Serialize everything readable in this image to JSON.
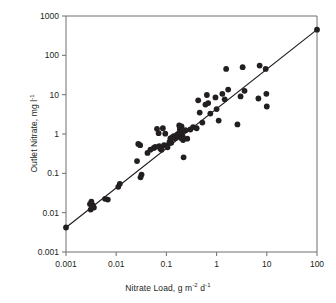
{
  "chart_data": {
    "type": "scatter",
    "title": "",
    "xlabel": "Nitrate Load, g m-2 d-1",
    "ylabel": "Outlet Nitrate, mg l-1",
    "xlabel_parts": {
      "text": "Nitrate Load, g m",
      "sup1": "-2",
      "mid": " d",
      "sup2": "-1"
    },
    "ylabel_parts": {
      "text": "Outlet Nitrate, mg l",
      "sup1": "-1"
    },
    "xscale": "log",
    "yscale": "log",
    "xlim": [
      0.001,
      100
    ],
    "ylim": [
      0.001,
      1000
    ],
    "xticks": [
      0.001,
      0.01,
      0.1,
      1,
      10,
      100
    ],
    "xtick_labels": [
      "0.001",
      "0.01",
      "0.1",
      "1",
      "10",
      "100"
    ],
    "yticks": [
      0.001,
      0.01,
      0.1,
      1,
      10,
      100,
      1000
    ],
    "ytick_labels": [
      "0.001",
      "0.01",
      "0.1",
      "1",
      "10",
      "100",
      "1000"
    ],
    "grid": false,
    "legend": false,
    "marker": {
      "shape": "circle",
      "color": "#231f20",
      "size": 4.6
    },
    "trendline": {
      "type": "line",
      "color": "#231f20",
      "width": 1.2,
      "x": [
        0.001,
        100
      ],
      "y": [
        0.0042,
        450
      ]
    },
    "points": [
      {
        "x": 0.001,
        "y": 0.0042
      },
      {
        "x": 0.003,
        "y": 0.0165
      },
      {
        "x": 0.0031,
        "y": 0.012
      },
      {
        "x": 0.0032,
        "y": 0.019
      },
      {
        "x": 0.0034,
        "y": 0.0155
      },
      {
        "x": 0.0036,
        "y": 0.0135
      },
      {
        "x": 0.006,
        "y": 0.0225
      },
      {
        "x": 0.0068,
        "y": 0.0215
      },
      {
        "x": 0.011,
        "y": 0.0455
      },
      {
        "x": 0.0118,
        "y": 0.054
      },
      {
        "x": 0.026,
        "y": 0.205
      },
      {
        "x": 0.0275,
        "y": 0.56
      },
      {
        "x": 0.03,
        "y": 0.52
      },
      {
        "x": 0.0305,
        "y": 0.079
      },
      {
        "x": 0.032,
        "y": 0.093
      },
      {
        "x": 0.042,
        "y": 0.33
      },
      {
        "x": 0.048,
        "y": 0.4
      },
      {
        "x": 0.056,
        "y": 0.44
      },
      {
        "x": 0.06,
        "y": 0.47
      },
      {
        "x": 0.065,
        "y": 1.35
      },
      {
        "x": 0.07,
        "y": 1.05
      },
      {
        "x": 0.072,
        "y": 0.49
      },
      {
        "x": 0.076,
        "y": 0.42
      },
      {
        "x": 0.08,
        "y": 0.395
      },
      {
        "x": 0.085,
        "y": 1.4
      },
      {
        "x": 0.09,
        "y": 0.52
      },
      {
        "x": 0.095,
        "y": 1.02
      },
      {
        "x": 0.1,
        "y": 0.5
      },
      {
        "x": 0.105,
        "y": 0.46
      },
      {
        "x": 0.115,
        "y": 0.62
      },
      {
        "x": 0.12,
        "y": 0.77
      },
      {
        "x": 0.125,
        "y": 0.6
      },
      {
        "x": 0.13,
        "y": 0.82
      },
      {
        "x": 0.14,
        "y": 0.88
      },
      {
        "x": 0.15,
        "y": 0.78
      },
      {
        "x": 0.16,
        "y": 0.93
      },
      {
        "x": 0.17,
        "y": 1.0
      },
      {
        "x": 0.175,
        "y": 0.88
      },
      {
        "x": 0.18,
        "y": 1.65
      },
      {
        "x": 0.185,
        "y": 1.3
      },
      {
        "x": 0.19,
        "y": 0.93
      },
      {
        "x": 0.195,
        "y": 0.79
      },
      {
        "x": 0.2,
        "y": 1.55
      },
      {
        "x": 0.205,
        "y": 1.12
      },
      {
        "x": 0.21,
        "y": 0.87
      },
      {
        "x": 0.215,
        "y": 0.7
      },
      {
        "x": 0.22,
        "y": 0.255
      },
      {
        "x": 0.24,
        "y": 1.25
      },
      {
        "x": 0.26,
        "y": 0.76
      },
      {
        "x": 0.3,
        "y": 1.3
      },
      {
        "x": 0.34,
        "y": 1.5
      },
      {
        "x": 0.4,
        "y": 1.4
      },
      {
        "x": 0.43,
        "y": 7.2
      },
      {
        "x": 0.46,
        "y": 3.5
      },
      {
        "x": 0.52,
        "y": 1.95
      },
      {
        "x": 0.6,
        "y": 5.6
      },
      {
        "x": 0.64,
        "y": 9.8
      },
      {
        "x": 0.68,
        "y": 6.1
      },
      {
        "x": 0.75,
        "y": 3.3
      },
      {
        "x": 0.95,
        "y": 8.5
      },
      {
        "x": 1.0,
        "y": 4.3
      },
      {
        "x": 1.1,
        "y": 2.2
      },
      {
        "x": 1.3,
        "y": 10.5
      },
      {
        "x": 1.45,
        "y": 7.6
      },
      {
        "x": 1.55,
        "y": 45.0
      },
      {
        "x": 1.7,
        "y": 13.5
      },
      {
        "x": 2.6,
        "y": 1.75
      },
      {
        "x": 3.0,
        "y": 9.0
      },
      {
        "x": 3.3,
        "y": 50.0
      },
      {
        "x": 3.6,
        "y": 12.5
      },
      {
        "x": 6.8,
        "y": 8.0
      },
      {
        "x": 7.2,
        "y": 55.0
      },
      {
        "x": 9.5,
        "y": 45.0
      },
      {
        "x": 9.8,
        "y": 10.5
      },
      {
        "x": 10.0,
        "y": 5.0
      },
      {
        "x": 100.0,
        "y": 450.0
      }
    ]
  }
}
